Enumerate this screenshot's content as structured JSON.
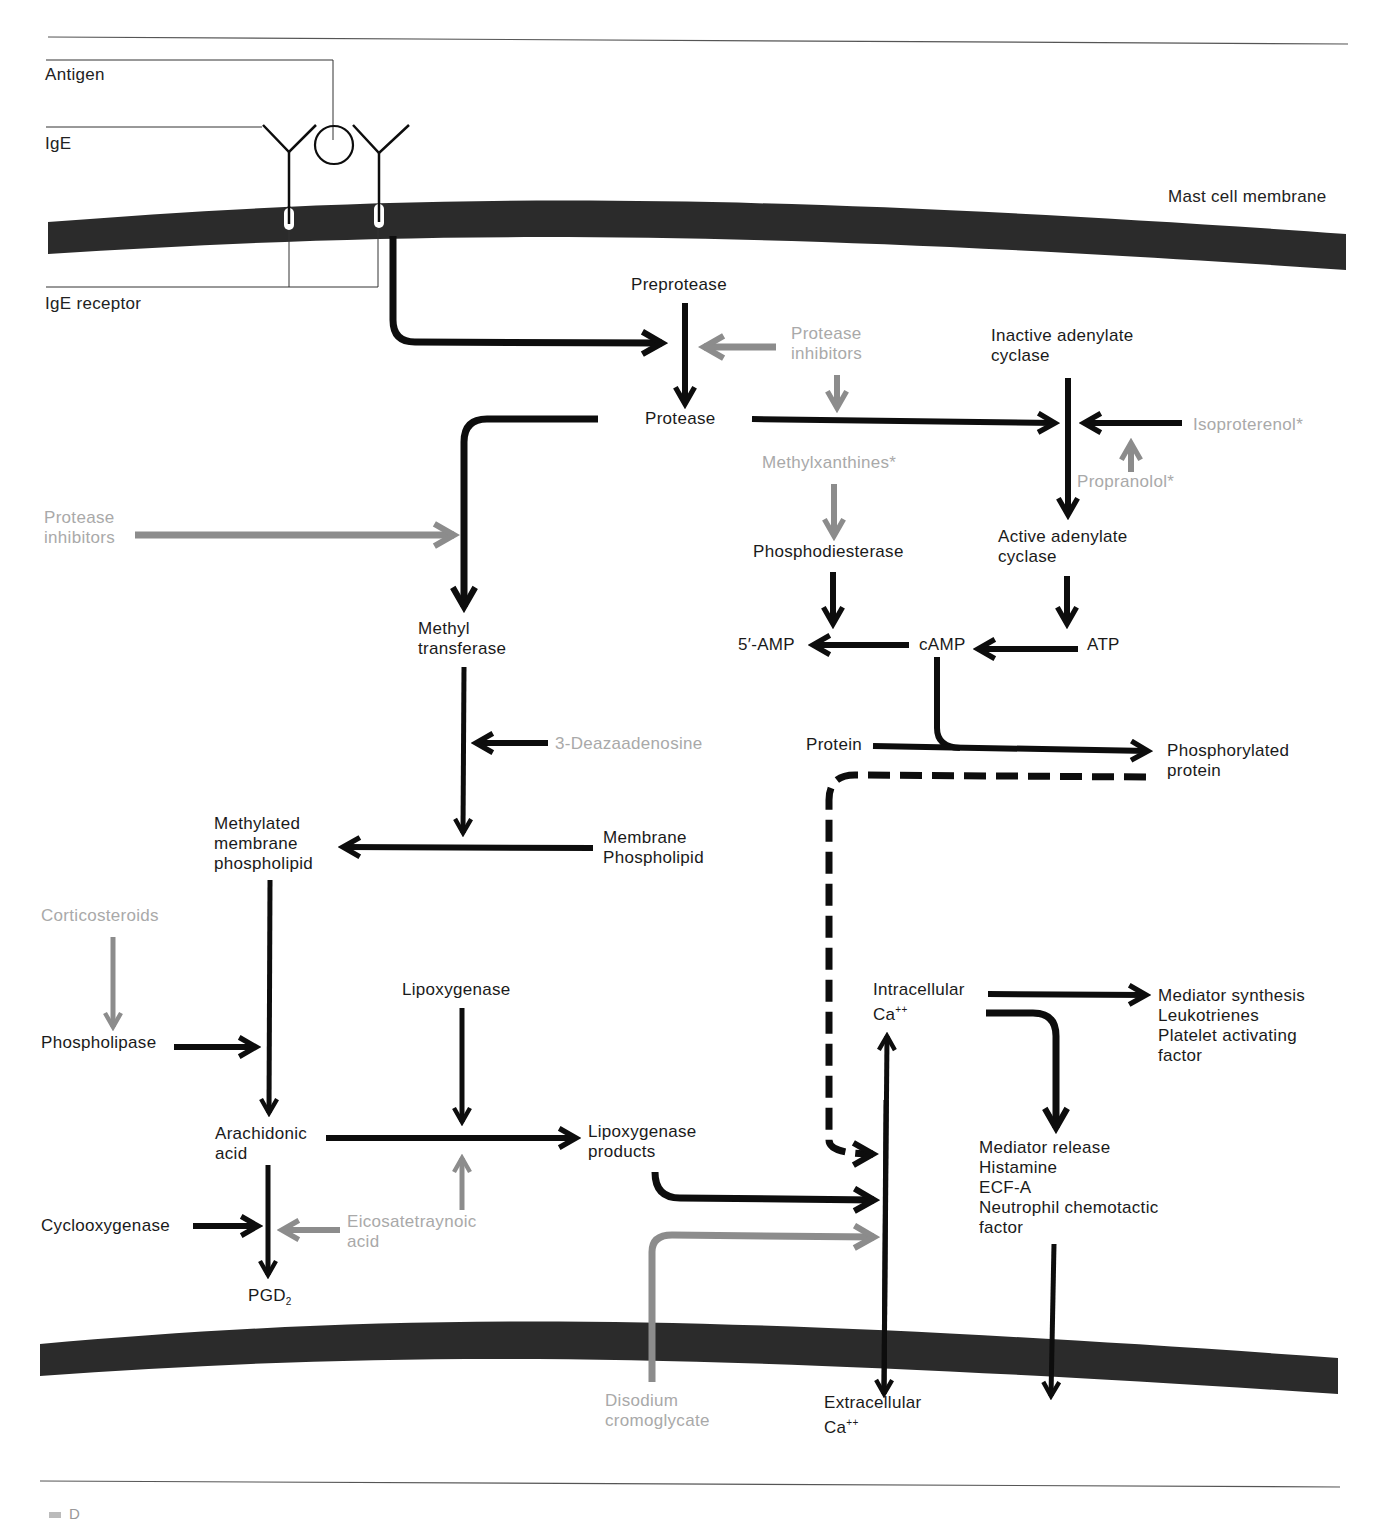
{
  "colors": {
    "pathway": "#0d0d0d",
    "drug_arrow": "#8c8c8c",
    "drug_text": "#a9a9a9",
    "membrane": "#2b2b2b",
    "rule": "#555555"
  },
  "callouts": {
    "antigen": "Antigen",
    "ige": "IgE",
    "ige_receptor": "IgE receptor",
    "mast_cell_membrane": "Mast cell membrane"
  },
  "nodes": {
    "preprotease": "Preprotease",
    "protease": "Protease",
    "inactive_adenylate_cyclase": "Inactive adenylate\ncyclase",
    "active_adenylate_cyclase": "Active adenylate\ncyclase",
    "phosphodiesterase": "Phosphodiesterase",
    "five_amp": "5′-AMP",
    "camp": "cAMP",
    "atp": "ATP",
    "protein": "Protein",
    "phosphorylated_protein": "Phosphorylated\nprotein",
    "methyl_transferase": "Methyl\ntransferase",
    "methylated_membrane_phospholipid": "Methylated\nmembrane\nphospholipid",
    "membrane_phospholipid": "Membrane\nPhospholipid",
    "phospholipase": "Phospholipase",
    "arachidonic_acid": "Arachidonic\nacid",
    "lipoxygenase": "Lipoxygenase",
    "lipoxygenase_products": "Lipoxygenase\nproducts",
    "cyclooxygenase": "Cyclooxygenase",
    "pgd2": "PGD",
    "pgd2_sub": "2",
    "intracellular_ca": "Intracellular\nCa",
    "intracellular_ca_sup": "++",
    "extracellular_ca": "Extracellular\nCa",
    "extracellular_ca_sup": "++",
    "mediator_synthesis": "Mediator synthesis\nLeukotrienes\nPlatelet activating\nfactor",
    "mediator_release": "Mediator release\nHistamine\nECF-A\nNeutrophil chemotactic\nfactor"
  },
  "drugs": {
    "protease_inhibitors_top": "Protease\ninhibitors",
    "protease_inhibitors_left": "Protease\ninhibitors",
    "isoproterenol": "Isoproterenol*",
    "propranolol": "Propranolol*",
    "methylxanthines": "Methylxanthines*",
    "deazaadenosine": "3-Deazaadenosine",
    "corticosteroids": "Corticosteroids",
    "eicosatetraynoic_acid": "Eicosatetraynoic\nacid",
    "disodium_cromoglycate": "Disodium\ncromoglycate"
  },
  "footer": {
    "label": "D"
  }
}
